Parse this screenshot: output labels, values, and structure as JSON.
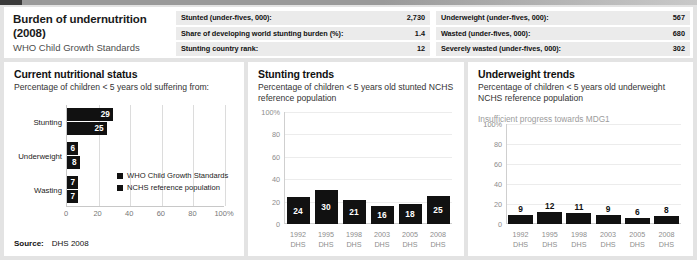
{
  "header": {
    "title": "Burden of undernutrition (2008)",
    "subtitle": "WHO Child Growth Standards",
    "stats_left": [
      {
        "label": "Stunted (under-fives, 000):",
        "value": "2,730"
      },
      {
        "label": "Share of developing world stunting burden (%):",
        "value": "1.4"
      },
      {
        "label": "Stunting country rank:",
        "value": "12"
      }
    ],
    "stats_right": [
      {
        "label": "Underweight (under-fives, 000):",
        "value": "567"
      },
      {
        "label": "Wasted (under-fives, 000):",
        "value": "680"
      },
      {
        "label": "Severely wasted (under-fives, 000):",
        "value": "302"
      }
    ]
  },
  "panel_current": {
    "title": "Current nutritional status",
    "subtitle": "Percentage of children < 5 years old suffering from:",
    "legend": [
      {
        "label": "WHO Child Growth Standards"
      },
      {
        "label": "NCHS reference population"
      }
    ],
    "source_label": "Source:",
    "source_value": "DHS 2008"
  },
  "panel_stunting": {
    "title": "Stunting trends",
    "subtitle": "Percentage of children < 5 years old stunted NCHS reference population"
  },
  "panel_underweight": {
    "title": "Underweight trends",
    "subtitle": "Percentage of children < 5 years old underweight NCHS reference population",
    "note": "Insufficient progress towards MDG1"
  },
  "chart_data": [
    {
      "type": "bar",
      "orientation": "horizontal",
      "title": "Current nutritional status",
      "xlabel": "",
      "ylabel": "",
      "categories": [
        "Stunting",
        "Underweight",
        "Wasting"
      ],
      "series": [
        {
          "name": "WHO Child Growth Standards",
          "values": [
            29,
            6,
            7
          ]
        },
        {
          "name": "NCHS reference population",
          "values": [
            25,
            8,
            7
          ]
        }
      ],
      "xlim": [
        0,
        100
      ],
      "xticks": [
        "0",
        "20",
        "40",
        "60",
        "80",
        "100%"
      ],
      "xtick_values": [
        0,
        20,
        40,
        60,
        80,
        100
      ],
      "grid": true,
      "legend_position": "inside-right",
      "bar_color": "#111111"
    },
    {
      "type": "bar",
      "orientation": "vertical",
      "title": "Stunting trends",
      "xlabel": "",
      "ylabel": "",
      "categories": [
        "1992",
        "1995",
        "1998",
        "2003",
        "2005",
        "2008"
      ],
      "category_sublabels": [
        "DHS",
        "DHS",
        "DHS",
        "DHS",
        "DHS",
        "DHS"
      ],
      "values": [
        24,
        30,
        21,
        16,
        18,
        25
      ],
      "ylim": [
        0,
        100
      ],
      "yticks": [
        "100%",
        "80",
        "60",
        "40",
        "20",
        "0"
      ],
      "ytick_values": [
        100,
        80,
        60,
        40,
        20,
        0
      ],
      "grid": true,
      "label_position": "inside",
      "bar_color": "#111111"
    },
    {
      "type": "bar",
      "orientation": "vertical",
      "title": "Underweight trends",
      "xlabel": "",
      "ylabel": "",
      "categories": [
        "1992",
        "1995",
        "1998",
        "2003",
        "2005",
        "2008"
      ],
      "category_sublabels": [
        "DHS",
        "DHS",
        "DHS",
        "DHS",
        "DHS",
        "DHS"
      ],
      "values": [
        9,
        12,
        11,
        9,
        6,
        8
      ],
      "ylim": [
        0,
        100
      ],
      "yticks": [
        "100%",
        "80",
        "60",
        "40",
        "20",
        "0"
      ],
      "ytick_values": [
        100,
        80,
        60,
        40,
        20,
        0
      ],
      "grid": true,
      "label_position": "above",
      "bar_color": "#111111"
    }
  ]
}
